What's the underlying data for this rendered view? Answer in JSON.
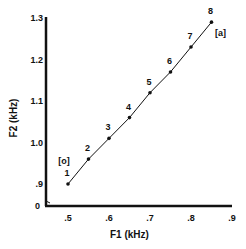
{
  "chart_data": {
    "type": "line",
    "title": "",
    "xlabel": "F1 (kHz)",
    "ylabel": "F2 (kHz)",
    "xlim": [
      0.45,
      0.9
    ],
    "ylim": [
      0.85,
      1.3
    ],
    "x_ticks": [
      ".5",
      ".6",
      ".7",
      ".8",
      ".9"
    ],
    "y_ticks": [
      ".9",
      "1.0",
      "1.1",
      "1.2",
      "1.3"
    ],
    "y_origin_label": "0",
    "grid": false,
    "series": [
      {
        "name": "[o] to [a] continuum",
        "points": [
          {
            "label": "1",
            "x": 0.5,
            "y": 0.9
          },
          {
            "label": "2",
            "x": 0.55,
            "y": 0.96
          },
          {
            "label": "3",
            "x": 0.6,
            "y": 1.01
          },
          {
            "label": "4",
            "x": 0.65,
            "y": 1.06
          },
          {
            "label": "5",
            "x": 0.7,
            "y": 1.12
          },
          {
            "label": "6",
            "x": 0.75,
            "y": 1.17
          },
          {
            "label": "7",
            "x": 0.8,
            "y": 1.23
          },
          {
            "label": "8",
            "x": 0.85,
            "y": 1.29
          }
        ]
      }
    ],
    "annotations": [
      {
        "text": "[o]",
        "near_point": "1"
      },
      {
        "text": "[a]",
        "near_point": "8"
      }
    ]
  }
}
